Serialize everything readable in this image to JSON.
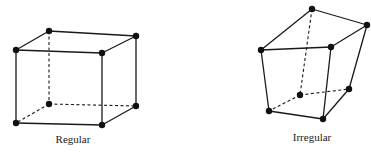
{
  "figures": [
    {
      "name": "regular",
      "label": "Regular",
      "label_pos": [
        73,
        133
      ],
      "vertices": {
        "ftl": [
          16,
          50
        ],
        "ftr": [
          102,
          53
        ],
        "fbl": [
          16,
          123
        ],
        "fbr": [
          102,
          125
        ],
        "btl": [
          49,
          31
        ],
        "btr": [
          136,
          36
        ],
        "bbl": [
          49,
          104
        ],
        "bbr": [
          136,
          106
        ]
      },
      "solid_edges": [
        [
          "ftl",
          "ftr"
        ],
        [
          "ftr",
          "fbr"
        ],
        [
          "fbr",
          "fbl"
        ],
        [
          "fbl",
          "ftl"
        ],
        [
          "ftl",
          "btl"
        ],
        [
          "btl",
          "btr"
        ],
        [
          "btr",
          "ftr"
        ],
        [
          "btr",
          "bbr"
        ],
        [
          "bbr",
          "fbr"
        ]
      ],
      "hidden_edges": [
        [
          "btl",
          "bbl"
        ],
        [
          "bbl",
          "bbr"
        ],
        [
          "bbl",
          "fbl"
        ]
      ]
    },
    {
      "name": "irregular",
      "label": "Irregular",
      "label_pos": [
        312,
        131
      ],
      "vertices": {
        "ftl": [
          261,
          50
        ],
        "ftr": [
          331,
          47
        ],
        "fbl": [
          269,
          111
        ],
        "fbr": [
          323,
          119
        ],
        "btl": [
          312,
          9
        ],
        "btr": [
          367,
          25
        ],
        "bbl": [
          300,
          95
        ],
        "bbr": [
          349,
          89
        ]
      },
      "solid_edges": [
        [
          "ftl",
          "ftr"
        ],
        [
          "ftr",
          "fbr"
        ],
        [
          "fbr",
          "fbl"
        ],
        [
          "fbl",
          "ftl"
        ],
        [
          "ftl",
          "btl"
        ],
        [
          "btl",
          "btr"
        ],
        [
          "btr",
          "ftr"
        ],
        [
          "btr",
          "bbr"
        ],
        [
          "bbr",
          "fbr"
        ]
      ],
      "hidden_edges": [
        [
          "btl",
          "bbl"
        ],
        [
          "bbl",
          "bbr"
        ],
        [
          "bbl",
          "fbl"
        ]
      ]
    }
  ],
  "style": {
    "line_color": "#1a1a1a",
    "node_color": "#111111",
    "node_radius": 3.2
  }
}
